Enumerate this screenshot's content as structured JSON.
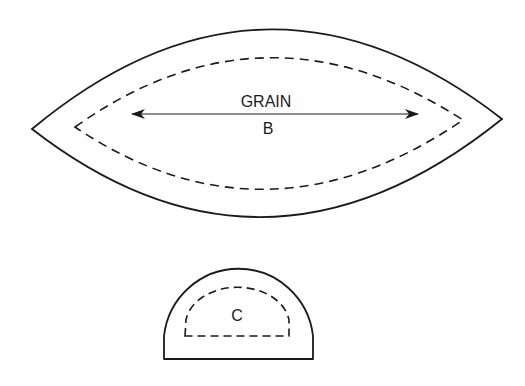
{
  "diagram": {
    "type": "sewing-pattern-pieces",
    "colors": {
      "line": "#1a1a1a",
      "background": "#ffffff"
    },
    "pieces": [
      {
        "id": "B",
        "shape": "lens",
        "label": "B",
        "grainline": {
          "label": "GRAIN",
          "direction": "horizontal",
          "arrows": "both-ends"
        },
        "cut_line": "solid",
        "seam_line": "dashed"
      },
      {
        "id": "C",
        "shape": "half-circle",
        "label": "C",
        "cut_line": "solid",
        "seam_line": "dashed"
      }
    ]
  }
}
